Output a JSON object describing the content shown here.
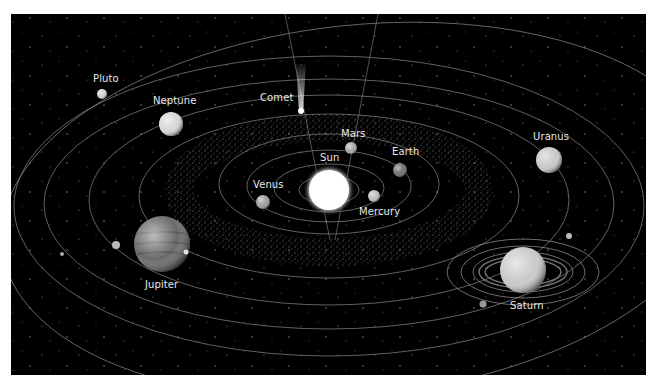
{
  "diagram": {
    "type": "solar-system-illustration",
    "background_color": "#000000",
    "frame": {
      "x": 11,
      "y": 14,
      "width": 635,
      "height": 361
    },
    "center": {
      "name": "Sun",
      "x": 329,
      "y": 190,
      "r": 21
    },
    "orbits": [
      {
        "rx": 30,
        "ry": 14
      },
      {
        "rx": 55,
        "ry": 24
      },
      {
        "rx": 82,
        "ry": 36
      },
      {
        "rx": 110,
        "ry": 50
      },
      {
        "rx": 195,
        "ry": 82
      },
      {
        "rx": 245,
        "ry": 105
      },
      {
        "rx": 290,
        "ry": 125
      },
      {
        "rx": 320,
        "ry": 148
      },
      {
        "rx": 350,
        "ry": 178
      }
    ],
    "asteroid_belt": {
      "rx": 150,
      "ry": 66,
      "width": 26
    },
    "bodies": [
      {
        "name": "Sun",
        "label": "Sun",
        "x": 329,
        "y": 190,
        "r": 21,
        "color": "#ffffff",
        "label_x": 320,
        "label_y": 152
      },
      {
        "name": "Mercury",
        "label": "Mercury",
        "x": 374,
        "y": 196,
        "r": 6,
        "color": "#bdbdbd",
        "label_x": 359,
        "label_y": 206
      },
      {
        "name": "Venus",
        "label": "Venus",
        "x": 263,
        "y": 202,
        "r": 7,
        "color": "#9e9e9e",
        "label_x": 253,
        "label_y": 179
      },
      {
        "name": "Earth",
        "label": "Earth",
        "x": 400,
        "y": 170,
        "r": 7,
        "color": "#6e6e6e",
        "label_x": 392,
        "label_y": 146
      },
      {
        "name": "Mars",
        "label": "Mars",
        "x": 351,
        "y": 148,
        "r": 6,
        "color": "#a8a8a8",
        "label_x": 341,
        "label_y": 128
      },
      {
        "name": "Jupiter",
        "label": "Jupiter",
        "x": 162,
        "y": 244,
        "r": 28,
        "color": "#6a6a6a",
        "label_x": 145,
        "label_y": 279
      },
      {
        "name": "Saturn",
        "label": "Saturn",
        "x": 523,
        "y": 270,
        "r": 23,
        "color": "#c9c9c9",
        "label_x": 510,
        "label_y": 300
      },
      {
        "name": "Uranus",
        "label": "Uranus",
        "x": 549,
        "y": 160,
        "r": 13,
        "color": "#c8c8c8",
        "label_x": 533,
        "label_y": 131
      },
      {
        "name": "Neptune",
        "label": "Neptune",
        "x": 171,
        "y": 124,
        "r": 12,
        "color": "#d6d6d6",
        "label_x": 153,
        "label_y": 95
      },
      {
        "name": "Pluto",
        "label": "Pluto",
        "x": 102,
        "y": 94,
        "r": 5,
        "color": "#d0d0d0",
        "label_x": 93,
        "label_y": 73
      },
      {
        "name": "Comet",
        "label": "Comet",
        "x": 301,
        "y": 110,
        "r": 3,
        "color": "#ffffff",
        "label_x": 260,
        "label_y": 92
      }
    ],
    "moons": [
      {
        "near": "Jupiter",
        "x": 116,
        "y": 245,
        "r": 4
      },
      {
        "near": "Jupiter",
        "x": 62,
        "y": 255,
        "r": 2
      },
      {
        "near": "Saturn",
        "x": 569,
        "y": 236,
        "r": 3
      },
      {
        "near": "Saturn",
        "x": 483,
        "y": 304,
        "r": 3
      }
    ]
  },
  "labels": {
    "sun": "Sun",
    "mercury": "Mercury",
    "venus": "Venus",
    "earth": "Earth",
    "mars": "Mars",
    "jupiter": "Jupiter",
    "saturn": "Saturn",
    "uranus": "Uranus",
    "neptune": "Neptune",
    "pluto": "Pluto",
    "comet": "Comet"
  }
}
